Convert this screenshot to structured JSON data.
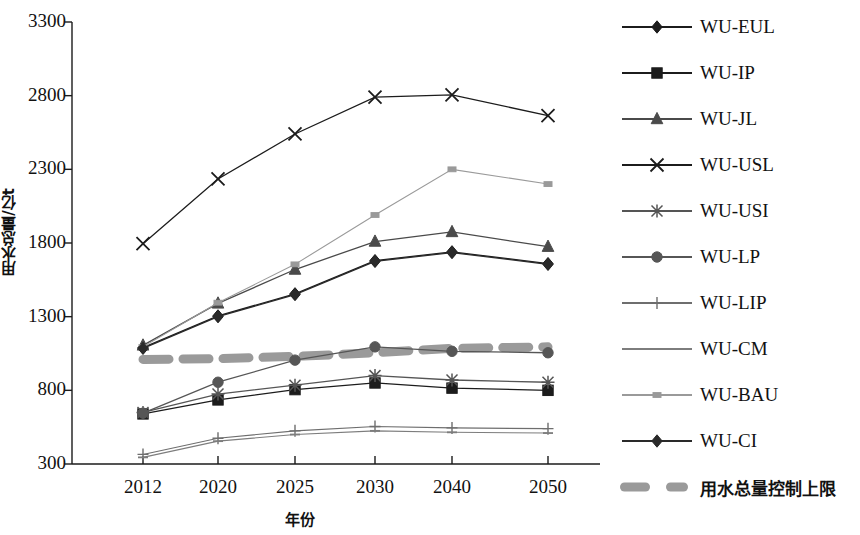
{
  "chart_data": {
    "type": "line",
    "title": "",
    "xlabel": "年份",
    "ylabel": "用水总量/亿t",
    "categories": [
      "2012",
      "2020",
      "2025",
      "2030",
      "2040",
      "2050"
    ],
    "x_tick_labels": [
      "2012",
      "2020",
      "2025",
      "2030",
      "2040",
      "2050"
    ],
    "y_tick_labels": [
      "300",
      "800",
      "1300",
      "1800",
      "2300",
      "2800",
      "3300"
    ],
    "ylim": [
      300,
      3300
    ],
    "grid": false,
    "legend_position": "right",
    "series": [
      {
        "name": "WU-EUL",
        "marker": "diamond",
        "color": "#1c1c1c",
        "values": [
          1090,
          1305,
          1455,
          1680,
          1740,
          1660
        ]
      },
      {
        "name": "WU-IP",
        "marker": "square",
        "color": "#1c1c1c",
        "values": [
          640,
          735,
          805,
          850,
          815,
          800
        ]
      },
      {
        "name": "WU-JL",
        "marker": "triangle",
        "color": "#4a4a4a",
        "values": [
          1105,
          1390,
          1620,
          1810,
          1875,
          1775
        ]
      },
      {
        "name": "WU-USL",
        "marker": "cross-x",
        "color": "#1c1c1c",
        "values": [
          1795,
          2235,
          2540,
          2790,
          2805,
          2665
        ]
      },
      {
        "name": "WU-USI",
        "marker": "asterisk",
        "color": "#555555",
        "values": [
          650,
          775,
          835,
          900,
          870,
          855
        ]
      },
      {
        "name": "WU-LP",
        "marker": "circle",
        "color": "#565656",
        "values": [
          645,
          855,
          1005,
          1095,
          1065,
          1055
        ]
      },
      {
        "name": "WU-LIP",
        "marker": "plus",
        "color": "#6e6e6e",
        "values": [
          365,
          475,
          525,
          555,
          545,
          540
        ]
      },
      {
        "name": "WU-CM",
        "marker": "dash",
        "color": "#7d7d7d",
        "values": [
          345,
          455,
          500,
          525,
          515,
          510
        ]
      },
      {
        "name": "WU-BAU",
        "marker": "small-square",
        "color": "#9a9a9a",
        "values": [
          1095,
          1395,
          1655,
          1990,
          2300,
          2200
        ]
      },
      {
        "name": "WU-CI",
        "marker": "diamond",
        "color": "#2a2a2a",
        "values": [
          1085,
          1300,
          1450,
          1675,
          1735,
          1655
        ]
      }
    ],
    "limit_line": {
      "name": "用水总量控制上限",
      "style": "thick-dashed",
      "color": "#9a9a9a",
      "values": [
        1010,
        1015,
        1030,
        1055,
        1085,
        1095
      ]
    }
  },
  "legend": {
    "items": [
      {
        "label": "WU-EUL",
        "marker": "diamond-marker"
      },
      {
        "label": "WU-IP",
        "marker": "square-marker"
      },
      {
        "label": "WU-JL",
        "marker": "triangle-marker"
      },
      {
        "label": "WU-USL",
        "marker": "x-marker"
      },
      {
        "label": "WU-USI",
        "marker": "asterisk-marker"
      },
      {
        "label": "WU-LP",
        "marker": "circle-marker"
      },
      {
        "label": "WU-LIP",
        "marker": "plus-marker"
      },
      {
        "label": "WU-CM",
        "marker": "dash-marker"
      },
      {
        "label": "WU-BAU",
        "marker": "small-square-marker"
      },
      {
        "label": "WU-CI",
        "marker": "diamond-marker"
      },
      {
        "label": "用水总量控制上限",
        "marker": "thick-dashed-marker"
      }
    ]
  },
  "colors": {
    "axis": "#1b1b1b",
    "limit": "#9a9a9a",
    "background": "#ffffff"
  }
}
